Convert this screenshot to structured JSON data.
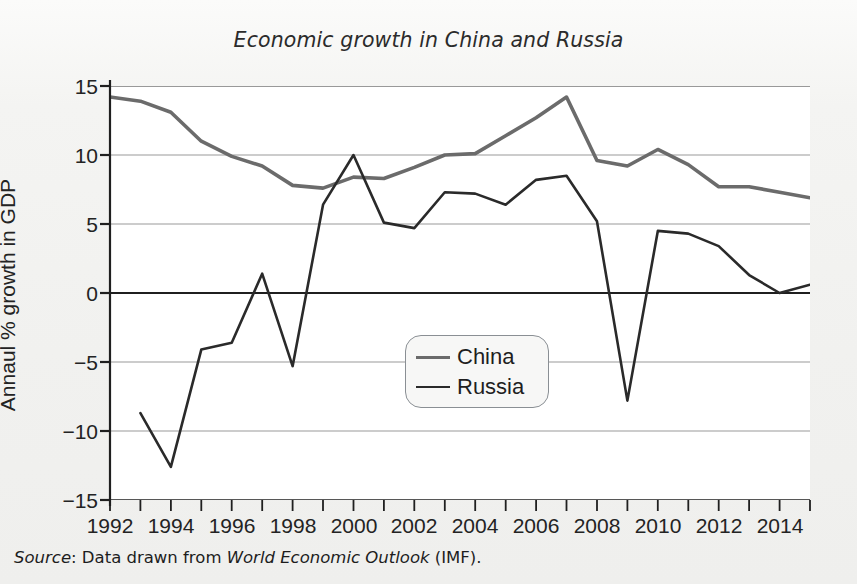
{
  "figure": {
    "title": "Economic growth in China and Russia",
    "ylabel": "Annaul % growth in GDP",
    "source_prefix": "Source",
    "source_text_1": ": Data drawn from ",
    "source_italic": "World Economic Outlook",
    "source_text_2": " (IMF)."
  },
  "legend": {
    "position": "center",
    "entries": [
      {
        "label": "China",
        "color": "#6b6b6b"
      },
      {
        "label": "Russia",
        "color": "#2a2a2a"
      }
    ]
  },
  "axes": {
    "y_ticks": [
      "15",
      "10",
      "5",
      "0",
      "−5",
      "−10",
      "−15"
    ],
    "y_tick_values": [
      15,
      10,
      5,
      0,
      -5,
      -10,
      -15
    ],
    "x_ticks_labeled": [
      "1992",
      "1994",
      "1996",
      "1998",
      "2000",
      "2002",
      "2004",
      "2006",
      "2008",
      "2010",
      "2012",
      "2014"
    ],
    "x_tick_values_all": [
      1992,
      1993,
      1994,
      1995,
      1996,
      1997,
      1998,
      1999,
      2000,
      2001,
      2002,
      2003,
      2004,
      2005,
      2006,
      2007,
      2008,
      2009,
      2010,
      2011,
      2012,
      2013,
      2014,
      2015
    ]
  },
  "chart_data": {
    "type": "line",
    "title": "Economic growth in China and Russia",
    "xlabel": "",
    "ylabel": "Annaul % growth in GDP",
    "xlim": [
      1992,
      2015
    ],
    "ylim": [
      -15,
      15
    ],
    "grid": "horizontal",
    "legend_position": "center",
    "x": [
      1992,
      1993,
      1994,
      1995,
      1996,
      1997,
      1998,
      1999,
      2000,
      2001,
      2002,
      2003,
      2004,
      2005,
      2006,
      2007,
      2008,
      2009,
      2010,
      2011,
      2012,
      2013,
      2014,
      2015
    ],
    "series": [
      {
        "name": "China",
        "color": "#6b6b6b",
        "x": [
          1992,
          1993,
          1994,
          1995,
          1996,
          1997,
          1998,
          1999,
          2000,
          2001,
          2002,
          2003,
          2004,
          2005,
          2006,
          2007,
          2008,
          2009,
          2010,
          2011,
          2012,
          2013,
          2014,
          2015
        ],
        "values": [
          14.2,
          13.9,
          13.1,
          11.0,
          9.9,
          9.2,
          7.8,
          7.6,
          8.4,
          8.3,
          9.1,
          10.0,
          10.1,
          11.4,
          12.7,
          14.2,
          9.6,
          9.2,
          10.4,
          9.3,
          7.7,
          7.7,
          7.3,
          6.9
        ]
      },
      {
        "name": "Russia",
        "color": "#2a2a2a",
        "x": [
          1993,
          1994,
          1995,
          1996,
          1997,
          1998,
          1999,
          2000,
          2001,
          2002,
          2003,
          2004,
          2005,
          2006,
          2007,
          2008,
          2009,
          2010,
          2011,
          2012,
          2013,
          2014,
          2015
        ],
        "values": [
          -8.7,
          -12.6,
          -4.1,
          -3.6,
          1.4,
          -5.3,
          6.4,
          10.0,
          5.1,
          4.7,
          7.3,
          7.2,
          6.4,
          8.2,
          8.5,
          5.2,
          -7.8,
          4.5,
          4.3,
          3.4,
          1.3,
          0.0,
          0.6
        ]
      }
    ]
  }
}
